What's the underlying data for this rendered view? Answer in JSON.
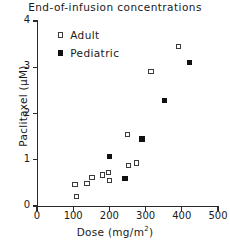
{
  "chart_data": {
    "type": "scatter",
    "title": "End-of-infusion concentrations",
    "xlabel": "Dose (mg/m2)",
    "xlabel_base": "Dose  (mg/m",
    "xlabel_sup": "2",
    "xlabel_tail": ")",
    "ylabel": "Paclitaxel  (μM)",
    "xlim": [
      0,
      500
    ],
    "ylim": [
      0,
      4
    ],
    "xticks": [
      0,
      100,
      200,
      300,
      400,
      500
    ],
    "yticks": [
      0,
      1,
      2,
      3,
      4
    ],
    "xtick_labels": [
      "0",
      "100",
      "200",
      "300",
      "400",
      "500"
    ],
    "ytick_labels": [
      "0",
      "1",
      "2",
      "3",
      "4"
    ],
    "grid": false,
    "legend_position": "upper-left-inside",
    "series": [
      {
        "name": "Adult",
        "marker": "open-square",
        "color": "#3a3a3a",
        "points": [
          [
            105,
            0.47
          ],
          [
            110,
            0.2
          ],
          [
            138,
            0.48
          ],
          [
            152,
            0.62
          ],
          [
            180,
            0.67
          ],
          [
            198,
            0.72
          ],
          [
            200,
            0.55
          ],
          [
            250,
            1.55
          ],
          [
            252,
            0.87
          ],
          [
            275,
            0.93
          ],
          [
            315,
            2.9
          ],
          [
            392,
            3.45
          ]
        ]
      },
      {
        "name": "Pediatric",
        "marker": "filled-square",
        "color": "#111111",
        "points": [
          [
            200,
            1.07
          ],
          [
            243,
            0.6
          ],
          [
            290,
            1.45
          ],
          [
            352,
            2.28
          ],
          [
            422,
            3.1
          ]
        ]
      }
    ]
  },
  "legend": {
    "items": [
      {
        "label": "Adult",
        "marker": "open-square"
      },
      {
        "label": "Pediatric",
        "marker": "filled-square"
      }
    ]
  }
}
